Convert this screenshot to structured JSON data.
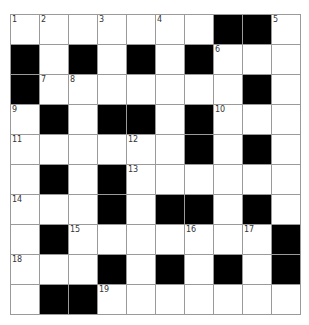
{
  "puzzle": {
    "rows": 10,
    "cols": 10,
    "colors": {
      "black": "#000000",
      "white": "#ffffff",
      "gridline": "#9a9a9a",
      "number": "#333333"
    },
    "grid": [
      "WWWWWWWBBW",
      "BWBWBWBWWW",
      "BWWWWWWWBW",
      "WBWBBWBWWW",
      "WWWWWWBWBW",
      "WBWBWWWWWW",
      "WWWBWBBWBW",
      "WBWWWWWWWB",
      "WWWBWBWBWB",
      "WBBWWWWWWW"
    ],
    "numbers": [
      {
        "r": 0,
        "c": 0,
        "n": "1"
      },
      {
        "r": 0,
        "c": 1,
        "n": "2"
      },
      {
        "r": 0,
        "c": 3,
        "n": "3"
      },
      {
        "r": 0,
        "c": 5,
        "n": "4"
      },
      {
        "r": 0,
        "c": 9,
        "n": "5"
      },
      {
        "r": 1,
        "c": 7,
        "n": "6"
      },
      {
        "r": 2,
        "c": 1,
        "n": "7"
      },
      {
        "r": 2,
        "c": 2,
        "n": "8"
      },
      {
        "r": 3,
        "c": 0,
        "n": "9"
      },
      {
        "r": 3,
        "c": 7,
        "n": "10"
      },
      {
        "r": 4,
        "c": 0,
        "n": "11"
      },
      {
        "r": 4,
        "c": 4,
        "n": "12"
      },
      {
        "r": 5,
        "c": 4,
        "n": "13"
      },
      {
        "r": 6,
        "c": 0,
        "n": "14"
      },
      {
        "r": 7,
        "c": 2,
        "n": "15"
      },
      {
        "r": 7,
        "c": 6,
        "n": "16"
      },
      {
        "r": 7,
        "c": 8,
        "n": "17"
      },
      {
        "r": 8,
        "c": 0,
        "n": "18"
      },
      {
        "r": 9,
        "c": 3,
        "n": "19"
      }
    ]
  }
}
